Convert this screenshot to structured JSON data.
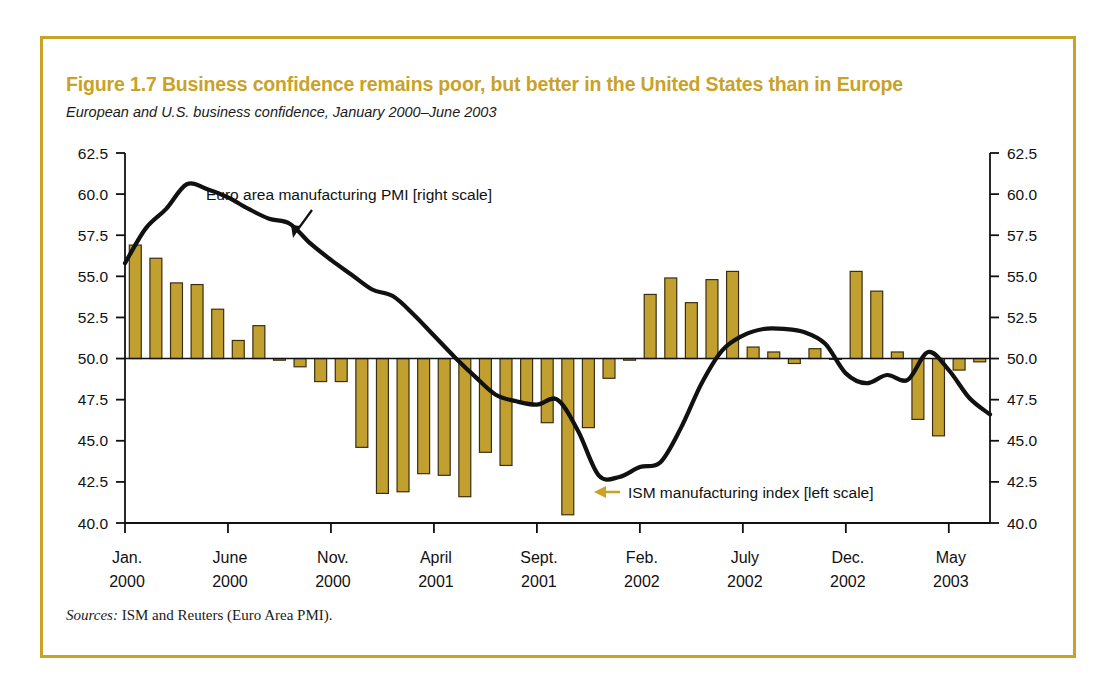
{
  "figure": {
    "title": "Figure 1.7  Business confidence remains poor, but better in the United States than in Europe",
    "subtitle": "European and U.S. business confidence, January 2000–June 2003",
    "source_label": "Sources:",
    "source_text": " ISM and Reuters (Euro Area PMI).",
    "border_color": "#c9a227",
    "title_color": "#c9a227"
  },
  "annotations": {
    "pmi_label": "Euro area manufacturing PMI [right scale]",
    "ism_label": "ISM manufacturing index [left scale]",
    "pmi_arrow_color": "#111111",
    "ism_arrow_color": "#c9a227"
  },
  "chart_data": {
    "type": "bar",
    "title": "Figure 1.7  Business confidence remains poor, but better in the United States than in Europe",
    "subtitle": "European and U.S. business confidence, January 2000–June 2003",
    "xlabel": "",
    "ylabel": "",
    "ylim": [
      40.0,
      62.5
    ],
    "yticks": [
      "40.0",
      "42.5",
      "45.0",
      "47.5",
      "50.0",
      "52.5",
      "55.0",
      "57.5",
      "60.0",
      "62.5"
    ],
    "ytick_values": [
      40.0,
      42.5,
      45.0,
      47.5,
      50.0,
      52.5,
      55.0,
      57.5,
      60.0,
      62.5
    ],
    "left_axis_title": "ISM manufacturing index [left scale]",
    "right_axis_title": "Euro area manufacturing PMI [right scale]",
    "baseline": 50.0,
    "grid": false,
    "legend": "annotation-arrows",
    "xtick_labels": [
      {
        "month": "Jan.",
        "year": "2000",
        "index": 0
      },
      {
        "month": "June",
        "year": "2000",
        "index": 5
      },
      {
        "month": "Nov.",
        "year": "2000",
        "index": 10
      },
      {
        "month": "April",
        "year": "2001",
        "index": 15
      },
      {
        "month": "Sept.",
        "year": "2001",
        "index": 20
      },
      {
        "month": "Feb.",
        "year": "2002",
        "index": 25
      },
      {
        "month": "July",
        "year": "2002",
        "index": 30
      },
      {
        "month": "Dec.",
        "year": "2002",
        "index": 35
      },
      {
        "month": "May",
        "year": "2003",
        "index": 40
      }
    ],
    "x_months": [
      "Jan 2000",
      "Feb 2000",
      "Mar 2000",
      "Apr 2000",
      "May 2000",
      "Jun 2000",
      "Jul 2000",
      "Aug 2000",
      "Sep 2000",
      "Oct 2000",
      "Nov 2000",
      "Dec 2000",
      "Jan 2001",
      "Feb 2001",
      "Mar 2001",
      "Apr 2001",
      "May 2001",
      "Jun 2001",
      "Jul 2001",
      "Aug 2001",
      "Sep 2001",
      "Oct 2001",
      "Nov 2001",
      "Dec 2001",
      "Jan 2002",
      "Feb 2002",
      "Mar 2002",
      "Apr 2002",
      "May 2002",
      "Jun 2002",
      "Jul 2002",
      "Aug 2002",
      "Sep 2002",
      "Oct 2002",
      "Nov 2002",
      "Dec 2002",
      "Jan 2003",
      "Feb 2003",
      "Mar 2003",
      "Apr 2003",
      "May 2003",
      "Jun 2003"
    ],
    "series": [
      {
        "name": "ISM manufacturing index [left scale]",
        "type": "bar",
        "axis": "left",
        "color": "#c2a02f",
        "edge_color": "#3a2f10",
        "values": [
          56.9,
          56.1,
          54.6,
          54.5,
          53.0,
          51.1,
          52.0,
          49.9,
          49.5,
          48.6,
          48.6,
          44.6,
          41.8,
          41.9,
          43.0,
          42.9,
          41.6,
          44.3,
          43.5,
          47.3,
          46.1,
          40.5,
          45.8,
          48.8,
          49.9,
          53.9,
          54.9,
          53.4,
          54.8,
          55.3,
          50.7,
          50.4,
          49.7,
          50.6,
          50.0,
          55.3,
          54.1,
          50.4,
          46.3,
          45.3,
          49.3,
          49.8
        ]
      },
      {
        "name": "Euro area manufacturing PMI [right scale]",
        "type": "line",
        "axis": "right",
        "color": "#111111",
        "values": [
          55.8,
          57.9,
          59.1,
          60.6,
          60.3,
          59.8,
          59.1,
          58.5,
          58.2,
          57.0,
          56.0,
          55.1,
          54.2,
          53.8,
          52.7,
          51.4,
          50.1,
          48.9,
          47.8,
          47.4,
          47.2,
          47.5,
          45.6,
          42.9,
          42.8,
          43.4,
          43.7,
          45.8,
          48.5,
          50.5,
          51.4,
          51.8,
          51.8,
          51.6,
          50.9,
          49.1,
          48.5,
          49.0,
          48.7,
          50.4,
          49.3,
          47.6,
          46.6
        ]
      }
    ]
  }
}
